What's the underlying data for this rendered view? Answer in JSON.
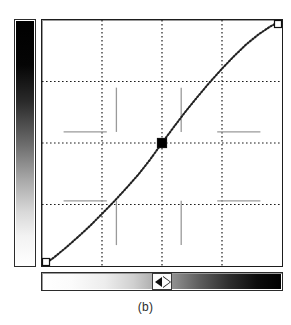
{
  "figure": {
    "caption": "(b)"
  },
  "input_ramp": {
    "name": "vertical-input-gradient",
    "orientation": "vertical",
    "from_label": "black",
    "to_label": "white",
    "from_color": "#000000",
    "to_color": "#ffffff"
  },
  "output_ramp": {
    "name": "horizontal-output-gradient",
    "orientation": "horizontal",
    "from_label": "white",
    "to_label": "black",
    "from_color": "#ffffff",
    "to_color": "#000000",
    "thumb_position_percent": 50,
    "thumb_left_icon": "triangle-left-icon",
    "thumb_right_icon": "triangle-right-icon"
  },
  "plot": {
    "grid_color": "#1d1d1d",
    "tick_color": "#9a9a9a",
    "curve_color": "#202020",
    "frame_color": "#1d1d1d",
    "background": "#ffffff"
  },
  "chart_data": {
    "type": "line",
    "xlabel": "",
    "ylabel": "",
    "xlim": [
      0,
      1
    ],
    "ylim": [
      0,
      1
    ],
    "grid": true,
    "grid_x": [
      0.25,
      0.5,
      0.75
    ],
    "grid_y": [
      0.25,
      0.5,
      0.75
    ],
    "legend": "none",
    "series": [
      {
        "name": "gamma curve",
        "style": "dotted",
        "x": [
          0.0,
          0.05,
          0.1,
          0.15,
          0.2,
          0.25,
          0.3,
          0.35,
          0.4,
          0.45,
          0.5,
          0.55,
          0.6,
          0.65,
          0.7,
          0.75,
          0.8,
          0.85,
          0.9,
          0.95,
          1.0
        ],
        "y": [
          0.0,
          0.035,
          0.075,
          0.118,
          0.163,
          0.212,
          0.262,
          0.315,
          0.37,
          0.432,
          0.5,
          0.566,
          0.63,
          0.69,
          0.748,
          0.802,
          0.853,
          0.9,
          0.94,
          0.973,
          1.0
        ]
      }
    ],
    "control_points": [
      {
        "name": "endpoint-low",
        "x": 0.0,
        "y": 0.0,
        "selected": false,
        "marker": "open-square"
      },
      {
        "name": "midpoint",
        "x": 0.5,
        "y": 0.5,
        "selected": true,
        "marker": "filled-square"
      },
      {
        "name": "endpoint-high",
        "x": 1.0,
        "y": 1.0,
        "selected": false,
        "marker": "open-square"
      }
    ],
    "tick_marks": [
      {
        "name": "tick-h-upper-left",
        "orientation": "horizontal",
        "x_from": 0.09,
        "x_to": 0.27,
        "y": 0.545
      },
      {
        "name": "tick-h-upper-right",
        "orientation": "horizontal",
        "x_from": 0.73,
        "x_to": 0.91,
        "y": 0.545
      },
      {
        "name": "tick-h-lower-left",
        "orientation": "horizontal",
        "x_from": 0.09,
        "x_to": 0.27,
        "y": 0.265
      },
      {
        "name": "tick-h-lower-right",
        "orientation": "horizontal",
        "x_from": 0.73,
        "x_to": 0.91,
        "y": 0.265
      },
      {
        "name": "tick-v-upper-left",
        "orientation": "vertical",
        "y_from": 0.545,
        "y_to": 0.725,
        "x": 0.31
      },
      {
        "name": "tick-v-upper-right",
        "orientation": "vertical",
        "y_from": 0.545,
        "y_to": 0.725,
        "x": 0.58
      },
      {
        "name": "tick-v-lower-left",
        "orientation": "vertical",
        "y_from": 0.085,
        "y_to": 0.265,
        "x": 0.31
      },
      {
        "name": "tick-v-lower-right",
        "orientation": "vertical",
        "y_from": 0.085,
        "y_to": 0.265,
        "x": 0.58
      }
    ]
  }
}
